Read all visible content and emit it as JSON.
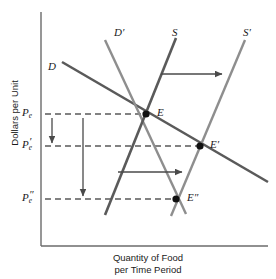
{
  "figure": {
    "axes": {
      "y_title": "Dollars per Unit",
      "x_title": "Quantity of Food\nper Time Period",
      "y_axis_x": 41,
      "x_axis_y": 246
    },
    "price_labels": [
      {
        "id": "pe",
        "base": "P",
        "sub": "e",
        "prime": "",
        "y": 114
      },
      {
        "id": "pe1",
        "base": "P",
        "sub": "e",
        "prime": "′",
        "y": 146
      },
      {
        "id": "pe2",
        "base": "P",
        "sub": "e",
        "prime": "″",
        "y": 199
      }
    ],
    "curve_labels": [
      {
        "id": "d",
        "text": "D",
        "prime": "",
        "x": 48,
        "y": 61
      },
      {
        "id": "d1",
        "text": "D",
        "prime": "′",
        "x": 114,
        "y": 27
      },
      {
        "id": "s",
        "text": "S",
        "prime": "",
        "x": 172,
        "y": 27
      },
      {
        "id": "s1",
        "text": "S",
        "prime": "′",
        "x": 243,
        "y": 27
      }
    ],
    "equilibrium_labels": [
      {
        "id": "e",
        "text": "E",
        "prime": "",
        "x": 157,
        "y": 107
      },
      {
        "id": "e1",
        "text": "E",
        "prime": "′",
        "x": 210,
        "y": 139
      },
      {
        "id": "e2",
        "text": "E",
        "prime": "″",
        "x": 187,
        "y": 192
      }
    ]
  },
  "chart_data": {
    "type": "line",
    "title": "",
    "xlabel": "Quantity of Food per Time Period",
    "ylabel": "Dollars per Unit",
    "grid": false,
    "legend": "inline-curve-labels",
    "axis_note": "Unlabeled qualitative axes; only equilibrium price levels Pe, Pe', Pe'' marked on the vertical axis.",
    "curves": [
      {
        "name": "D",
        "label": "D",
        "role": "original-demand",
        "color": "#5a5a5a",
        "width": 2.6,
        "x1": 62,
        "y1": 62,
        "x2": 268,
        "y2": 182
      },
      {
        "name": "D'",
        "label": "D′",
        "role": "shifted-demand-leftward",
        "color": "#8e8e8e",
        "width": 2.4,
        "x1": 105,
        "y1": 40,
        "x2": 186,
        "y2": 214
      },
      {
        "name": "S",
        "label": "S",
        "role": "original-supply",
        "color": "#5a5a5a",
        "width": 2.6,
        "x1": 105,
        "y1": 215,
        "x2": 176,
        "y2": 38
      },
      {
        "name": "S'",
        "label": "S′",
        "role": "shifted-supply-rightward",
        "color": "#8e8e8e",
        "width": 2.4,
        "x1": 171,
        "y1": 216,
        "x2": 245,
        "y2": 40
      }
    ],
    "equilibria": [
      {
        "name": "E",
        "label": "E",
        "x": 146,
        "y": 114,
        "price_level": "Pe",
        "note": "intersection of D and S"
      },
      {
        "name": "E'",
        "label": "E′",
        "x": 200,
        "y": 146,
        "price_level": "Pe'",
        "note": "intersection of D and S'"
      },
      {
        "name": "E''",
        "label": "E″",
        "x": 176,
        "y": 199,
        "price_level": "Pe''",
        "note": "intersection of D' and S'"
      }
    ],
    "price_lines": [
      {
        "name": "Pe",
        "y": 114,
        "x_from": 45,
        "x_to": 146
      },
      {
        "name": "Pe'",
        "y": 146,
        "x_from": 45,
        "x_to": 200
      },
      {
        "name": "Pe''",
        "y": 199,
        "x_from": 45,
        "x_to": 176
      }
    ],
    "annotation_arrows": [
      {
        "id": "supply-shift-arrow-upper",
        "direction": "right",
        "x1": 161,
        "y1": 74,
        "x2": 222,
        "y2": 74,
        "meaning": "supply curve shifts right from S to S'"
      },
      {
        "id": "supply-shift-arrow-lower",
        "direction": "right",
        "x1": 118,
        "y1": 172,
        "x2": 182,
        "y2": 172,
        "meaning": "quantity increases toward S'"
      },
      {
        "id": "price-drop-arrow-short",
        "direction": "down",
        "x1": 52,
        "y1": 118,
        "x2": 52,
        "y2": 143,
        "meaning": "price falls from Pe to Pe'"
      },
      {
        "id": "price-drop-arrow-long",
        "direction": "down",
        "x1": 83,
        "y1": 118,
        "x2": 83,
        "y2": 196,
        "meaning": "price falls from Pe to Pe''"
      }
    ]
  },
  "style": {
    "axis_color": "#6b6b6b",
    "dashed_color": "#5a5a5a",
    "arrow_color": "#4a4a4a",
    "point_color": "#111111",
    "text_color": "#1a1a1a"
  }
}
